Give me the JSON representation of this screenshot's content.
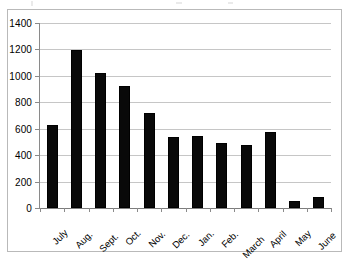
{
  "chart_data": {
    "type": "bar",
    "title": "",
    "xlabel": "",
    "ylabel": "",
    "categories": [
      "July",
      "Aug.",
      "Sept.",
      "Oct.",
      "Nov.",
      "Dec.",
      "Jan.",
      "Feb.",
      "March",
      "April",
      "May",
      "June"
    ],
    "values": [
      625,
      1195,
      1025,
      925,
      720,
      535,
      545,
      490,
      480,
      575,
      50,
      85
    ],
    "ylim": [
      0,
      1400
    ],
    "ytick_labels": [
      "0",
      "200",
      "400",
      "600",
      "800",
      "1000",
      "1200",
      "1400"
    ],
    "ytick_values": [
      0,
      200,
      400,
      600,
      800,
      1000,
      1200,
      1400
    ],
    "grid": true,
    "legend": null,
    "series": [
      {
        "name": "",
        "color": "#090909",
        "values": [
          625,
          1195,
          1025,
          925,
          720,
          535,
          545,
          490,
          480,
          575,
          50,
          85
        ]
      }
    ]
  },
  "colors": {
    "bar": "#090909",
    "gridline": "#c6c6c6",
    "axis": "#8a8a8a",
    "frame": "#b9b9b9",
    "background": "#ffffff",
    "text": "#000000"
  }
}
